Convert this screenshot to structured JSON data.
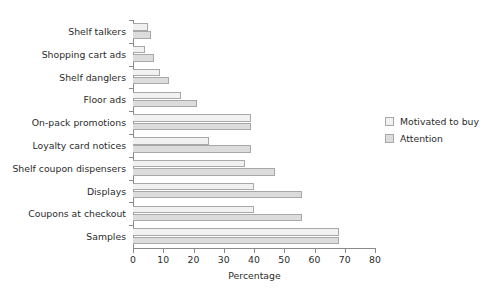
{
  "chart_data": {
    "type": "bar",
    "orientation": "horizontal",
    "title": "",
    "xlabel": "Percentage",
    "ylabel": "",
    "xlim": [
      0,
      80
    ],
    "xticks": [
      0,
      10,
      20,
      30,
      40,
      50,
      60,
      70,
      80
    ],
    "grid": false,
    "legend_position": "right",
    "categories": [
      "Shelf talkers",
      "Shopping cart ads",
      "Shelf danglers",
      "Floor ads",
      "On-pack promotions",
      "Loyalty card notices",
      "Shelf coupon dispensers",
      "Displays",
      "Coupons at checkout",
      "Samples"
    ],
    "series": [
      {
        "name": "Motivated to buy",
        "color": "#f1f1f1",
        "values": [
          5,
          4,
          9,
          16,
          39,
          25,
          37,
          40,
          40,
          68
        ]
      },
      {
        "name": "Attention",
        "color": "#dcdcdc",
        "values": [
          6,
          7,
          12,
          21,
          39,
          39,
          47,
          56,
          56,
          68
        ]
      }
    ]
  },
  "legend": {
    "items": [
      {
        "label": "Motivated to buy"
      },
      {
        "label": "Attention"
      }
    ]
  },
  "axis": {
    "x_title": "Percentage",
    "tick_labels": [
      "0",
      "10",
      "20",
      "30",
      "40",
      "50",
      "60",
      "70",
      "80"
    ]
  },
  "colors": {
    "motivated_to_buy": "#f1f1f1",
    "attention": "#dcdcdc",
    "bar_border": "#a8a8a8",
    "axis": "#8a8a8a",
    "text": "#2b2b2b",
    "background": "#ffffff"
  }
}
